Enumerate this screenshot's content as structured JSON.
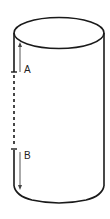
{
  "diagram": {
    "type": "cylinder",
    "labels": {
      "a": "A",
      "b": "B"
    },
    "arrows": [
      {
        "label": "A",
        "direction": "up"
      },
      {
        "label": "B",
        "direction": "down"
      }
    ],
    "colors": {
      "stroke": "#1a1a1a",
      "arrow": "#444444",
      "background": "#ffffff"
    }
  }
}
